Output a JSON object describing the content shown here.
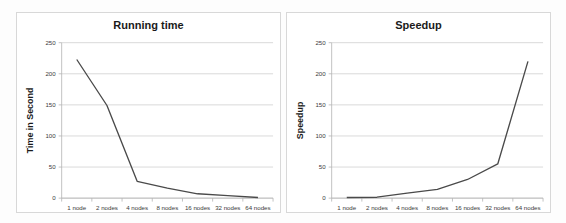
{
  "figure": {
    "background_color": "#fdfdfd",
    "panel_border_color": "#d8d8d8",
    "line_color": "#4a4a4a",
    "grid_color": "#c9c9c9"
  },
  "charts": [
    {
      "key": "running_time",
      "title": "Running time",
      "ylabel": "Time in Second"
    },
    {
      "key": "speedup",
      "title": "Speedup",
      "ylabel": "Speedup"
    }
  ],
  "chart_data": [
    {
      "type": "line",
      "title": "Running time",
      "xlabel": "",
      "ylabel": "Time in Second",
      "categories": [
        "1 node",
        "2 nodes",
        "4 nodes",
        "8 nodes",
        "16 nodes",
        "32 nodes",
        "64 nodes"
      ],
      "values": [
        223,
        149,
        27,
        16,
        7,
        4,
        1
      ],
      "ylim": [
        0,
        250
      ],
      "yticks": [
        0,
        50,
        100,
        150,
        200,
        250
      ],
      "grid": true,
      "legend": false
    },
    {
      "type": "line",
      "title": "Speedup",
      "xlabel": "",
      "ylabel": "Speedup",
      "categories": [
        "1 node",
        "2 nodes",
        "4 nodes",
        "8 nodes",
        "16 nodes",
        "32 nodes",
        "64 nodes"
      ],
      "values": [
        1,
        1.5,
        8,
        14,
        30,
        55,
        220
      ],
      "ylim": [
        0,
        250
      ],
      "yticks": [
        0,
        50,
        100,
        150,
        200,
        250
      ],
      "grid": true,
      "legend": false
    }
  ]
}
